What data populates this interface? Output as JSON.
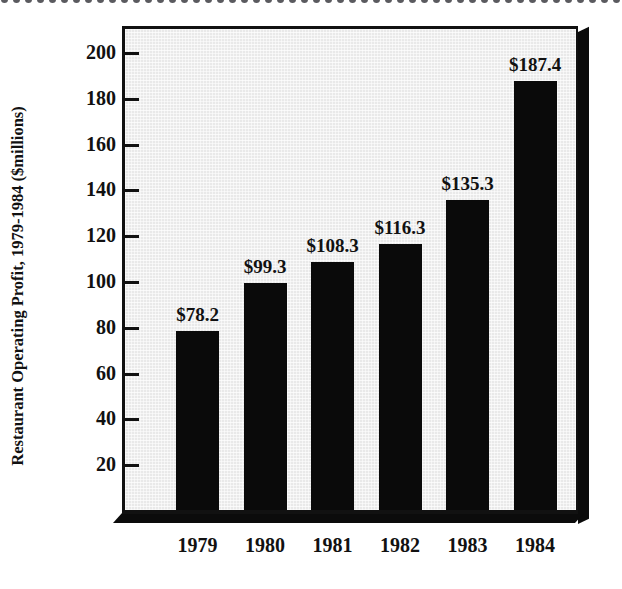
{
  "decoration": {
    "top_dots": {
      "name": "dotted-border",
      "count": 52,
      "spacing_px": 12,
      "color": "#5a5a5f"
    }
  },
  "chart_data": {
    "type": "bar",
    "title": "",
    "xlabel": "",
    "ylabel": "Restaurant Operating Profit, 1979-1984 ($millions)",
    "categories": [
      "1979",
      "1980",
      "1981",
      "1982",
      "1983",
      "1984"
    ],
    "values": [
      78.2,
      99.3,
      108.3,
      116.3,
      135.3,
      187.4
    ],
    "data_labels": [
      "$78.2",
      "$99.3",
      "$108.3",
      "$116.3",
      "$135.3",
      "$187.4"
    ],
    "ylim": [
      0,
      210
    ],
    "yticks": [
      20,
      40,
      60,
      80,
      100,
      120,
      140,
      160,
      180,
      200
    ],
    "ytick_labels": [
      "20",
      "40",
      "60",
      "80",
      "100",
      "120",
      "140",
      "160",
      "180",
      "200"
    ],
    "grid": false,
    "legend": false,
    "legend_position": "none",
    "bar_color": "#0a0a0a",
    "plot_background": "#e9e9e9",
    "axis_color": "#111111",
    "style": "3d-shadow-frame"
  }
}
